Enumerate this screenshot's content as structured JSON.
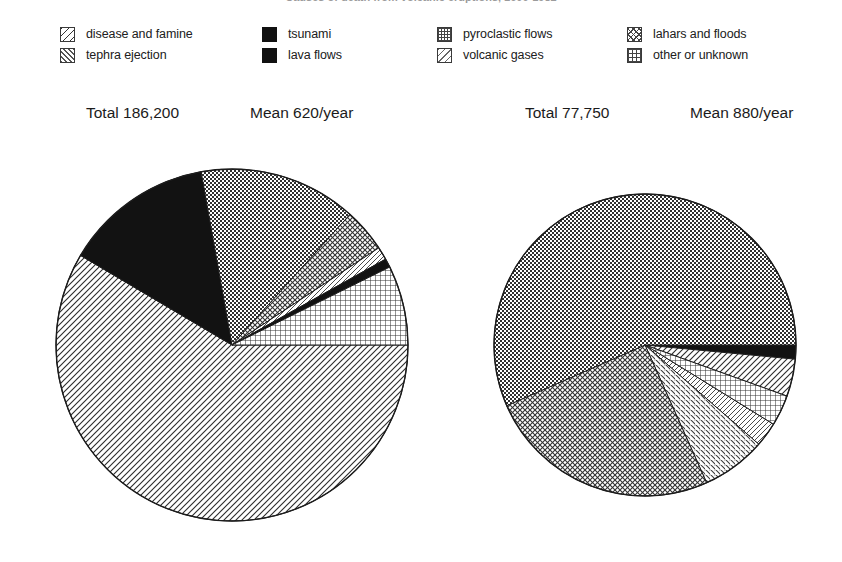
{
  "title": "Causes of death from volcanic eruptions, 1600-1982",
  "legend": {
    "columns": [
      {
        "x": 60,
        "items": [
          {
            "label": "disease and famine",
            "pattern": "diag-back",
            "swatch_class": "sw-diag-back"
          },
          {
            "label": "tephra ejection",
            "pattern": "diag-fwd",
            "swatch_class": "sw-diag-fwd"
          }
        ]
      },
      {
        "x": 262,
        "items": [
          {
            "label": "tsunami",
            "pattern": "solid",
            "swatch_class": "solid"
          },
          {
            "label": "lava flows",
            "pattern": "solid",
            "swatch_class": "solid"
          }
        ]
      },
      {
        "x": 437,
        "items": [
          {
            "label": "pyroclastic flows",
            "pattern": "dots",
            "swatch_class": "sw-dots"
          },
          {
            "label": "volcanic gases",
            "pattern": "diag-back-2",
            "swatch_class": "sw-diag-back-2"
          }
        ]
      },
      {
        "x": 627,
        "items": [
          {
            "label": "lahars and floods",
            "pattern": "cross-diag",
            "swatch_class": "sw-cross-diag"
          },
          {
            "label": "other or unknown",
            "pattern": "grid",
            "swatch_class": "sw-grid"
          }
        ]
      }
    ]
  },
  "chart_data": [
    {
      "type": "pie",
      "id": "left-pie",
      "title": "Total 186,200",
      "subtitle": "Mean 620/year",
      "total": 186200,
      "total_label": "Total 186,200",
      "mean_label": "Mean 620/year",
      "mean_per_year": 620,
      "center": [
        232,
        345
      ],
      "radius": 176,
      "start_angle_deg": 0,
      "direction": "clockwise",
      "categories": [
        "disease and famine",
        "lava flows",
        "pyroclastic flows",
        "lahars and floods",
        "volcanic gases",
        "tsunami",
        "other or unknown"
      ],
      "values": [
        109000,
        25500,
        27000,
        7500,
        2200,
        1400,
        13600
      ],
      "percents": [
        58.5,
        13.7,
        14.5,
        4.0,
        1.2,
        0.8,
        7.3
      ],
      "slices": [
        {
          "label": "disease and famine",
          "percent": 58.5,
          "pattern": "diag-back",
          "start_deg": 0.0,
          "end_deg": 210.6
        },
        {
          "label": "lava flows",
          "percent": 13.7,
          "pattern": "solid",
          "start_deg": 210.6,
          "end_deg": 259.9
        },
        {
          "label": "pyroclastic flows",
          "percent": 14.5,
          "pattern": "dots",
          "start_deg": 259.9,
          "end_deg": 312.1
        },
        {
          "label": "lahars and floods",
          "percent": 4.0,
          "pattern": "cross-diag",
          "start_deg": 312.1,
          "end_deg": 326.5
        },
        {
          "label": "volcanic gases",
          "percent": 1.2,
          "pattern": "diag-back-2",
          "start_deg": 326.5,
          "end_deg": 330.8
        },
        {
          "label": "tsunami",
          "percent": 0.8,
          "pattern": "solid",
          "start_deg": 330.8,
          "end_deg": 333.7
        },
        {
          "label": "other or unknown",
          "percent": 7.3,
          "pattern": "grid",
          "start_deg": 333.7,
          "end_deg": 360.0
        }
      ]
    },
    {
      "type": "pie",
      "id": "right-pie",
      "title": "Total 77,750",
      "subtitle": "Mean 880/year",
      "total": 77750,
      "total_label": "Total 77,750",
      "mean_label": "Mean 880/year",
      "mean_per_year": 880,
      "center": [
        645,
        345
      ],
      "radius": 151,
      "start_angle_deg": 0,
      "direction": "clockwise",
      "categories": [
        "tsunami",
        "disease and famine",
        "other or unknown",
        "volcanic gases",
        "tephra ejection",
        "lahars and floods",
        "pyroclastic flows"
      ],
      "values": [
        1200,
        3100,
        2600,
        2000,
        5400,
        19500,
        43950
      ],
      "percents": [
        1.5,
        4.0,
        3.3,
        2.6,
        6.9,
        25.1,
        56.6
      ],
      "slices": [
        {
          "label": "tsunami",
          "percent": 1.5,
          "pattern": "solid",
          "start_deg": 0.0,
          "end_deg": 5.4
        },
        {
          "label": "disease and famine",
          "percent": 4.0,
          "pattern": "diag-back",
          "start_deg": 5.4,
          "end_deg": 19.8
        },
        {
          "label": "other or unknown",
          "percent": 3.3,
          "pattern": "grid",
          "start_deg": 19.8,
          "end_deg": 31.7
        },
        {
          "label": "volcanic gases",
          "percent": 2.6,
          "pattern": "diag-back-2",
          "start_deg": 31.7,
          "end_deg": 41.1
        },
        {
          "label": "tephra ejection",
          "percent": 6.9,
          "pattern": "diag-fwd",
          "start_deg": 41.1,
          "end_deg": 65.9
        },
        {
          "label": "lahars and floods",
          "percent": 25.1,
          "pattern": "cross-diag",
          "start_deg": 65.9,
          "end_deg": 156.3
        },
        {
          "label": "pyroclastic flows",
          "percent": 56.6,
          "pattern": "dots",
          "start_deg": 156.3,
          "end_deg": 360.0
        }
      ]
    }
  ],
  "captions": [
    {
      "text": "Total 186,200",
      "x": 86,
      "y": 104
    },
    {
      "text": "Mean 620/year",
      "x": 250,
      "y": 104
    },
    {
      "text": "Total 77,750",
      "x": 525,
      "y": 104
    },
    {
      "text": "Mean 880/year",
      "x": 690,
      "y": 104
    }
  ]
}
